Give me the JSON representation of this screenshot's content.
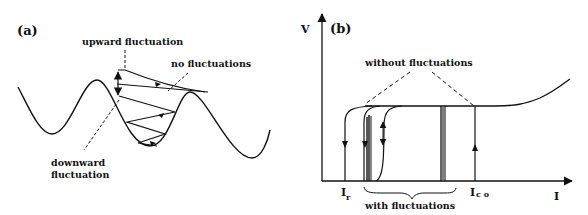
{
  "panel_a": {
    "label": "(a)",
    "annotations": {
      "upward": "upward fluctuation",
      "none": "no fluctuations",
      "downward_1": "downward",
      "downward_2": "fluctuation"
    }
  },
  "panel_b": {
    "label": "(b)",
    "y_axis": "V",
    "x_axis": "I",
    "tick_ir_main": "I",
    "tick_ir_sub": "r",
    "tick_ico_main": "I",
    "tick_ico_sub": "c o",
    "annotations": {
      "without": "without fluctuations",
      "with": "with fluctuations"
    }
  },
  "colors": {
    "ink": "#111111",
    "background": "#ffffff"
  }
}
